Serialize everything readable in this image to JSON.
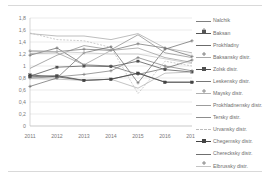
{
  "chart_data": {
    "type": "line",
    "title": "",
    "xlabel": "",
    "ylabel": "",
    "grid": true,
    "legend_position": "right",
    "categories": [
      "2011",
      "2012",
      "2013",
      "2014",
      "2015",
      "2016",
      "2017"
    ],
    "x": [
      2011,
      2012,
      2013,
      2014,
      2015,
      2016,
      2017
    ],
    "ylim": [
      0,
      1.8
    ],
    "ytick_labels": [
      "0",
      "0,2",
      "0,4",
      "0,6",
      "0,8",
      "1",
      "1,2",
      "1,4",
      "1,6",
      "1,8"
    ],
    "ytick_values": [
      0,
      0.2,
      0.4,
      0.6,
      0.8,
      1.0,
      1.2,
      1.4,
      1.6,
      1.8
    ],
    "series": [
      {
        "name": "Nalchik",
        "color": "#7f7f7f",
        "marker": "plus",
        "dashed": false,
        "values": [
          0.8,
          0.82,
          0.86,
          0.92,
          1.14,
          1.0,
          0.92
        ]
      },
      {
        "name": "Baksan",
        "color": "#555555",
        "marker": "square",
        "dashed": false,
        "values": [
          0.82,
          0.84,
          0.76,
          0.78,
          0.88,
          0.73,
          0.73
        ]
      },
      {
        "name": "Prokhladny",
        "color": "#6b6b6b",
        "marker": "plus",
        "dashed": false,
        "values": [
          1.18,
          1.3,
          1.02,
          1.0,
          0.86,
          0.96,
          1.1
        ]
      },
      {
        "name": "Baksansky distr.",
        "color": "#a8a8a8",
        "marker": "none",
        "dashed": false,
        "values": [
          1.54,
          1.5,
          1.5,
          1.44,
          1.54,
          1.3,
          1.22
        ]
      },
      {
        "name": "Zolsk distr.",
        "color": "#4f4f4f",
        "marker": "square",
        "dashed": false,
        "values": [
          0.83,
          0.98,
          1.0,
          0.99,
          1.08,
          0.94,
          0.9
        ]
      },
      {
        "name": "Leskensky distr.",
        "color": "#767676",
        "marker": "plus",
        "dashed": false,
        "values": [
          1.25,
          1.24,
          1.28,
          1.26,
          1.37,
          1.3,
          1.16
        ]
      },
      {
        "name": "Maysky distr.",
        "color": "#b0b0b0",
        "marker": "none",
        "dashed": false,
        "values": [
          0.79,
          0.78,
          0.76,
          0.78,
          0.63,
          0.88,
          0.9
        ]
      },
      {
        "name": "Prokhladnensky distr.",
        "color": "#9c9c9c",
        "marker": "none",
        "dashed": false,
        "values": [
          1.21,
          1.22,
          1.02,
          1.26,
          1.3,
          1.14,
          1.06
        ]
      },
      {
        "name": "Tersky distr.",
        "color": "#8d8d8d",
        "marker": "none",
        "dashed": false,
        "values": [
          0.96,
          1.18,
          1.34,
          1.27,
          1.52,
          1.22,
          1.14
        ]
      },
      {
        "name": "Urvansky distr.",
        "color": "#bcbcbc",
        "marker": "none",
        "dashed": true,
        "values": [
          1.55,
          1.44,
          1.42,
          1.31,
          0.54,
          1.08,
          1.0
        ]
      },
      {
        "name": "Chegemsky distr.",
        "color": "#444444",
        "marker": "square",
        "dashed": false,
        "values": [
          0.85,
          0.82,
          0.76,
          0.78,
          0.88,
          0.73,
          0.73
        ]
      },
      {
        "name": "Cherecksky distr.",
        "color": "#6f6f6f",
        "marker": "plus",
        "dashed": false,
        "values": [
          0.66,
          0.8,
          1.22,
          1.32,
          0.72,
          1.28,
          1.42
        ]
      },
      {
        "name": "Elbrussky distr.",
        "color": "#c4c4c4",
        "marker": "none",
        "dashed": false,
        "values": [
          1.26,
          1.24,
          1.22,
          1.2,
          1.2,
          1.12,
          1.04
        ]
      }
    ]
  },
  "legend": {
    "items": [
      {
        "label": "Nalchik"
      },
      {
        "label": "Baksan"
      },
      {
        "label": "Prokhladny"
      },
      {
        "label": "Baksansky distr."
      },
      {
        "label": "Zolsk distr."
      },
      {
        "label": "Leskensky distr."
      },
      {
        "label": "Maysky distr."
      },
      {
        "label": "Prokhladnensky distr."
      },
      {
        "label": "Tersky distr."
      },
      {
        "label": "Urvansky distr."
      },
      {
        "label": "Chegemsky distr."
      },
      {
        "label": "Cherecksky distr."
      },
      {
        "label": "Elbrussky distr."
      }
    ]
  }
}
